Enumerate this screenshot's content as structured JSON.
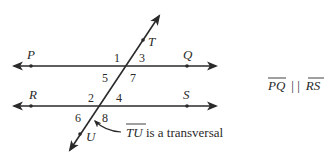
{
  "diagram": {
    "points": {
      "P": {
        "label": "P",
        "x": 31,
        "y": 66,
        "lx": 27,
        "ly": 59
      },
      "Q": {
        "label": "Q",
        "x": 187,
        "y": 66,
        "lx": 183,
        "ly": 59
      },
      "R": {
        "label": "R",
        "x": 31,
        "y": 106,
        "lx": 29,
        "ly": 99
      },
      "S": {
        "label": "S",
        "x": 187,
        "y": 106,
        "lx": 183,
        "ly": 99
      },
      "T": {
        "label": "T",
        "x": 143,
        "y": 39,
        "lx": 148,
        "ly": 46
      },
      "U": {
        "label": "U",
        "x": 80,
        "y": 133,
        "lx": 86,
        "ly": 141
      }
    },
    "angles": [
      {
        "label": "1",
        "x": 114,
        "y": 62
      },
      {
        "label": "3",
        "x": 139,
        "y": 62
      },
      {
        "label": "5",
        "x": 102,
        "y": 82
      },
      {
        "label": "7",
        "x": 130,
        "y": 82
      },
      {
        "label": "2",
        "x": 88,
        "y": 102
      },
      {
        "label": "4",
        "x": 116,
        "y": 102
      },
      {
        "label": "6",
        "x": 75,
        "y": 122
      },
      {
        "label": "8",
        "x": 102,
        "y": 122
      }
    ],
    "caption": {
      "segment": "TU",
      "text": " is a transversal"
    },
    "parallel_statement": {
      "left": "PQ",
      "symbol": "| |",
      "right": "RS"
    },
    "stroke_color": "#2a2a2a"
  }
}
